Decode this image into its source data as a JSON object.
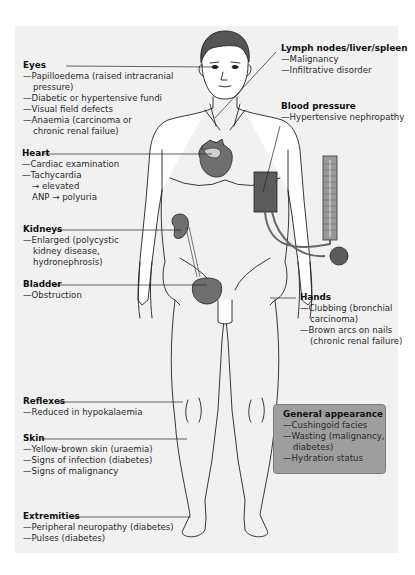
{
  "figure": {
    "colors": {
      "panel_bg": "#f1f1f1",
      "organ_fill": "#6f6f6f",
      "cuff_fill": "#5c5c5c",
      "line": "#222222",
      "general_box_bg": "#9e9e9e"
    }
  },
  "labels": {
    "eyes": {
      "title": "Eyes",
      "items": [
        "—Papilloedema (raised intracranial",
        "pressure)",
        "—Diabetic or hypertensive fundi",
        "—Visual field defects",
        "—Anaemia (carcinoma or",
        "chronic renal failue)"
      ]
    },
    "heart": {
      "title": "Heart",
      "items": [
        "—Cardiac examination",
        "—Tachycardia",
        "→ elevated",
        "ANP → polyuria"
      ]
    },
    "kidneys": {
      "title": "Kidneys",
      "items": [
        "—Enlarged (polycystic",
        "kidney disease,",
        "hydronephrosis)"
      ]
    },
    "bladder": {
      "title": "Bladder",
      "items": [
        "—Obstruction"
      ]
    },
    "reflexes": {
      "title": "Reflexes",
      "items": [
        "—Reduced in hypokalaemia"
      ]
    },
    "skin": {
      "title": "Skin",
      "items": [
        "—Yellow-brown skin (uraemia)",
        "—Signs of infection (diabetes)",
        "—Signs of malignancy"
      ]
    },
    "extremities": {
      "title": "Extremities",
      "items": [
        "—Peripheral neuropathy (diabetes)",
        "—Pulses (diabetes)"
      ]
    },
    "lymph": {
      "title": "Lymph nodes/liver/spleen",
      "items": [
        "—Malignancy",
        "—Infiltrative disorder"
      ]
    },
    "blood_pressure": {
      "title": "Blood pressure",
      "items": [
        "—Hypertensive nephropathy"
      ]
    },
    "hands": {
      "title": "Hands",
      "items": [
        "—Clubbing (bronchial",
        "carcinoma)",
        "—Brown arcs on nails",
        "(chronic renal failure)"
      ]
    },
    "general": {
      "title": "General appearance",
      "items": [
        "—Cushingoid facies",
        "—Wasting (malignancy,",
        "diabetes)",
        "—Hydration status"
      ]
    }
  }
}
